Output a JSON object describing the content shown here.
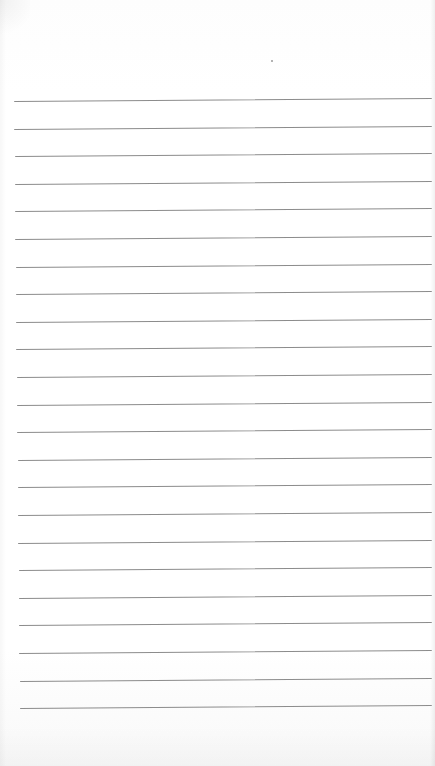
{
  "page": {
    "type": "lined-paper",
    "background_color": "#ffffff",
    "line_color": "#8c8c8c",
    "line_count": 23,
    "first_line_y": 101,
    "line_spacing": 27.6,
    "line_left_start_top": 14,
    "line_left_start_bottom": 20,
    "line_right_end": 432,
    "line_tilt_deg": -0.42,
    "speck": {
      "x": 271,
      "y": 60
    }
  }
}
